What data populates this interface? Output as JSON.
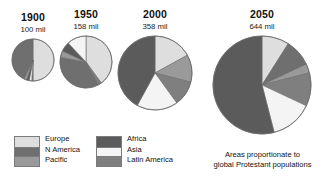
{
  "figure": {
    "caption_line1": "Areas proportionate to",
    "caption_line2": "global Protestant populations"
  },
  "colors": {
    "europe": "#dedede",
    "n_america": "#6f6f6f",
    "pacific": "#9a9a9a",
    "africa": "#5b5b5b",
    "asia": "#f4f4f4",
    "latin_america": "#7f7f7f",
    "outline": "#6b6b6b",
    "text": "#111111",
    "background": "#ffffff"
  },
  "legend": {
    "columns": [
      {
        "items": [
          {
            "label": "Europe",
            "color_key": "europe"
          },
          {
            "label": "N America",
            "color_key": "n_america"
          },
          {
            "label": "Pacific",
            "color_key": "pacific"
          }
        ]
      },
      {
        "items": [
          {
            "label": "Africa",
            "color_key": "africa"
          },
          {
            "label": "Asia",
            "color_key": "asia"
          },
          {
            "label": "Latin America",
            "color_key": "latin_america"
          }
        ]
      }
    ]
  },
  "chart_data": {
    "type": "pie",
    "title": "Areas proportionate to global Protestant populations",
    "note": "Four pie charts; disc area proportional to total population. Values are percentage shares of each year's total.",
    "legend_position": "bottom-left",
    "grid": false,
    "categories": [
      "Europe",
      "N America",
      "Pacific",
      "Africa",
      "Asia",
      "Latin America"
    ],
    "category_colors": [
      "#dedede",
      "#6f6f6f",
      "#9a9a9a",
      "#5b5b5b",
      "#f4f4f4",
      "#7f7f7f"
    ],
    "charts": [
      {
        "year": "1900",
        "total_label": "100 mil",
        "total_value": 100,
        "unit": "mil",
        "radius_px": 21,
        "center": {
          "x": 33,
          "y": 60
        },
        "start_angle_deg": -90,
        "slices": [
          {
            "name": "Europe",
            "percent": 50,
            "color": "#dedede"
          },
          {
            "name": "Latin America",
            "percent": 1,
            "color": "#7f7f7f"
          },
          {
            "name": "Asia",
            "percent": 2,
            "color": "#f4f4f4"
          },
          {
            "name": "Africa",
            "percent": 2,
            "color": "#5b5b5b"
          },
          {
            "name": "Pacific",
            "percent": 2,
            "color": "#9a9a9a"
          },
          {
            "name": "N America",
            "percent": 43,
            "color": "#6f6f6f"
          }
        ]
      },
      {
        "year": "1950",
        "total_label": "158 mil",
        "total_value": 158,
        "unit": "mil",
        "radius_px": 26,
        "center": {
          "x": 86,
          "y": 62
        },
        "start_angle_deg": -90,
        "slices": [
          {
            "name": "Europe",
            "percent": 40,
            "color": "#dedede"
          },
          {
            "name": "Latin America",
            "percent": 2,
            "color": "#7f7f7f"
          },
          {
            "name": "N America",
            "percent": 36,
            "color": "#6f6f6f"
          },
          {
            "name": "Pacific",
            "percent": 4,
            "color": "#9a9a9a"
          },
          {
            "name": "Africa",
            "percent": 6,
            "color": "#5b5b5b"
          },
          {
            "name": "Asia",
            "percent": 12,
            "color": "#f4f4f4"
          }
        ]
      },
      {
        "year": "2000",
        "total_label": "358 mil",
        "total_value": 358,
        "unit": "mil",
        "radius_px": 37,
        "center": {
          "x": 155,
          "y": 73
        },
        "start_angle_deg": -90,
        "slices": [
          {
            "name": "Europe",
            "percent": 17,
            "color": "#dedede"
          },
          {
            "name": "Pacific",
            "percent": 12,
            "color": "#9a9a9a"
          },
          {
            "name": "Latin America",
            "percent": 11,
            "color": "#7f7f7f"
          },
          {
            "name": "Asia",
            "percent": 18,
            "color": "#f4f4f4"
          },
          {
            "name": "Africa",
            "percent": 42,
            "color": "#5b5b5b"
          }
        ]
      },
      {
        "year": "2050",
        "total_label": "644 mil",
        "total_value": 644,
        "unit": "mil",
        "radius_px": 49,
        "center": {
          "x": 262,
          "y": 85
        },
        "start_angle_deg": -90,
        "slices": [
          {
            "name": "Europe",
            "percent": 9,
            "color": "#dedede"
          },
          {
            "name": "N America",
            "percent": 9,
            "color": "#6f6f6f"
          },
          {
            "name": "Pacific",
            "percent": 3,
            "color": "#9a9a9a"
          },
          {
            "name": "Latin America",
            "percent": 11,
            "color": "#7f7f7f"
          },
          {
            "name": "Asia",
            "percent": 14,
            "color": "#f4f4f4"
          },
          {
            "name": "Africa",
            "percent": 54,
            "color": "#5b5b5b"
          }
        ]
      }
    ]
  }
}
